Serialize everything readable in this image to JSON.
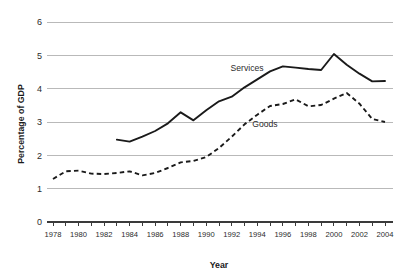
{
  "chart_data": {
    "type": "line",
    "title": "",
    "xlabel": "Year",
    "ylabel": "Percentage of GDP",
    "xlim": [
      1978,
      2004
    ],
    "ylim": [
      0,
      6
    ],
    "ytick_values": [
      0,
      1,
      2,
      3,
      4,
      5,
      6
    ],
    "ytick_labels": [
      "0",
      "1",
      "2",
      "3",
      "4",
      "5",
      "6"
    ],
    "xtick_values": [
      1978,
      1980,
      1982,
      1984,
      1986,
      1988,
      1990,
      1992,
      1994,
      1996,
      1998,
      2000,
      2002,
      2004
    ],
    "xtick_labels": [
      "1978",
      "1980",
      "1982",
      "1984",
      "1986",
      "1988",
      "1990",
      "1992",
      "1994",
      "1996",
      "1998",
      "2000",
      "2002",
      "2004"
    ],
    "minor_xticks_every": 1,
    "grid": "horizontal",
    "legend": "inline-annotations",
    "line_color": "#1a1a1a",
    "grid_color": "#b9b9b9",
    "series": [
      {
        "name": "Services",
        "style": "solid",
        "label_position": {
          "year": 1993.2,
          "value": 4.52
        },
        "x": [
          1983,
          1984,
          1985,
          1986,
          1987,
          1988,
          1989,
          1990,
          1991,
          1992,
          1993,
          1994,
          1995,
          1996,
          1997,
          1998,
          1999,
          2000,
          2001,
          2002,
          2003,
          2004
        ],
        "values": [
          2.47,
          2.41,
          2.56,
          2.73,
          2.96,
          3.29,
          3.05,
          3.35,
          3.62,
          3.76,
          4.04,
          4.28,
          4.52,
          4.67,
          4.63,
          4.59,
          4.56,
          5.04,
          4.72,
          4.45,
          4.22,
          4.23
        ]
      },
      {
        "name": "Goods",
        "style": "dashed",
        "label_position": {
          "year": 1994.6,
          "value": 2.84
        },
        "x": [
          1978,
          1979,
          1980,
          1981,
          1982,
          1983,
          1984,
          1985,
          1986,
          1987,
          1988,
          1989,
          1990,
          1991,
          1992,
          1993,
          1994,
          1995,
          1996,
          1997,
          1998,
          1999,
          2000,
          2001,
          2002,
          2003,
          2004
        ],
        "values": [
          1.29,
          1.52,
          1.54,
          1.45,
          1.44,
          1.47,
          1.52,
          1.4,
          1.47,
          1.62,
          1.79,
          1.83,
          1.95,
          2.22,
          2.56,
          2.93,
          3.22,
          3.48,
          3.54,
          3.68,
          3.47,
          3.51,
          3.7,
          3.87,
          3.55,
          3.09,
          3.0
        ]
      }
    ]
  },
  "labels": {
    "x_axis_title": "Year",
    "y_axis_title": "Percentage of GDP",
    "series_services": "Services",
    "series_goods": "Goods"
  }
}
